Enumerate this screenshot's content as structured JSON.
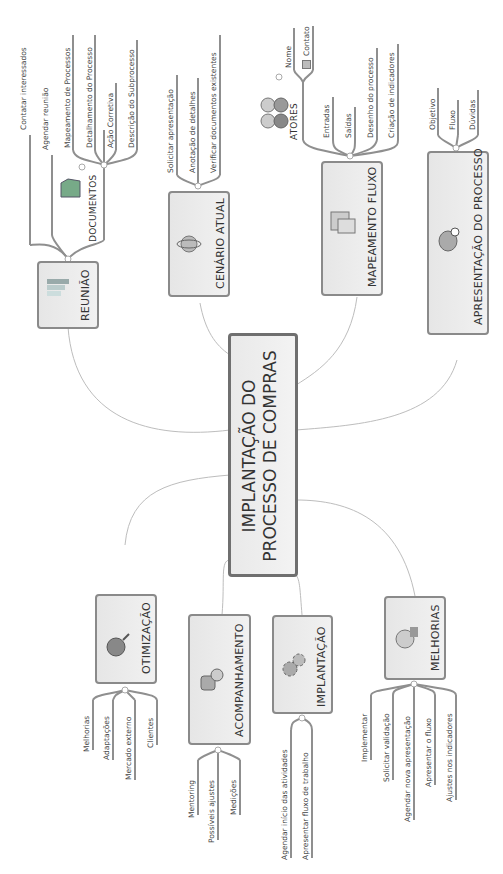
{
  "center": {
    "line1": "IMPLANTAÇÃO DO",
    "line2": "PROCESSO DE COMPRAS"
  },
  "branches": {
    "reuniao": {
      "title": "REUNIÃO",
      "icon": "bar-chart-icon",
      "children": [
        "Contatar interessados",
        "Agendar reunião"
      ]
    },
    "documentos": {
      "title": "DOCUMENTOS",
      "icon": "folder-icon",
      "children": [
        "Mapeamento de Processos",
        "Detalhamento do Processo",
        "Ação Corretiva",
        "Descrição do Subprocesso"
      ]
    },
    "cenario": {
      "title": "CENÁRIO ATUAL",
      "icon": "globe-icon",
      "children": [
        "Solicitar apresentação",
        "Anotação de detalhes",
        "Verificar documentos existentes"
      ]
    },
    "mapeamento": {
      "title": "MAPEAMENTO FLUXO",
      "icon": "calendar-icon",
      "children": [
        "Entradas",
        "Saídas",
        "Desenho do processo",
        "Criação de indicadores"
      ]
    },
    "atores": {
      "title": "ATORES",
      "icon": "people-icon",
      "children": [
        "Nome",
        "Contato"
      ]
    },
    "apresentacao": {
      "title": "APRESENTAÇÃO DO PROCESSO",
      "icon": "person-icon",
      "children": [
        "Objetivo",
        "Fluxo",
        "Dúvidas"
      ]
    },
    "otimizacao": {
      "title": "OTIMIZAÇÃO",
      "icon": "magnifier-icon",
      "children": [
        "Melhorias",
        "Adaptações",
        "Mercado externo",
        "Clientes"
      ]
    },
    "acompanhamento": {
      "title": "ACOMPANHAMENTO",
      "icon": "users-icon",
      "children": [
        "Mentoring",
        "Possíveis ajustes",
        "Medições"
      ]
    },
    "implantacao": {
      "title": "IMPLANTAÇÃO",
      "icon": "gears-icon",
      "children": [
        "Agendar início das atividades",
        "Apresentar fluxo de trabalho"
      ]
    },
    "melhorias": {
      "title": "MELHORIAS",
      "icon": "chart-ball-icon",
      "children": [
        "Implementar",
        "Solicitar validação",
        "Agendar nova apresentação",
        "Apresentar o fluxo",
        "Ajustes nos indicadores"
      ]
    }
  },
  "colors": {
    "line": "#b5b5b5",
    "underline": "#8f8f8f",
    "node_border": "#8a8a8a",
    "node_fill": "#ececec"
  }
}
